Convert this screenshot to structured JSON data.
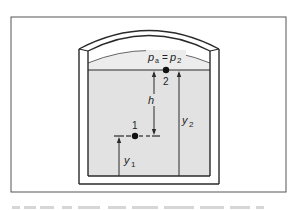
{
  "figure": {
    "labels": {
      "surface_pressure": "p",
      "surface_pressure_sub_a": "a",
      "equals": "=",
      "surface_pressure_rhs": "p",
      "surface_pressure_sub_2": "2",
      "point_2": "2",
      "point_1": "1",
      "depth": "h",
      "height_2": "y",
      "height_2_sub": "2",
      "height_1": "y",
      "height_1_sub": "1"
    },
    "colors": {
      "frame": "#555555",
      "ink": "#2a2a2a",
      "liquid": "#e2e2e2",
      "gas": "#ececec",
      "background": "#ffffff"
    }
  }
}
